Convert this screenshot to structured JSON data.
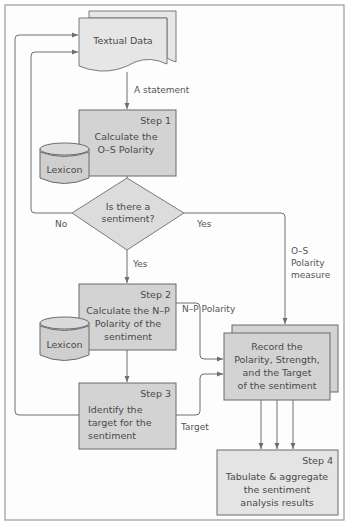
{
  "diagram": {
    "type": "flowchart",
    "nodes": {
      "textual_data": {
        "label": "Textual Data"
      },
      "step1": {
        "step": "Step 1",
        "lines": [
          "Calculate the",
          "O–S Polarity"
        ]
      },
      "lexicon1": {
        "label": "Lexicon"
      },
      "decision": {
        "lines": [
          "Is there a",
          "sentiment?"
        ]
      },
      "step2": {
        "step": "Step 2",
        "lines": [
          "Calculate the N–P",
          "Polarity of the",
          "sentiment"
        ]
      },
      "lexicon2": {
        "label": "Lexicon"
      },
      "step3": {
        "step": "Step 3",
        "lines": [
          "Identify the",
          "target for the",
          "sentiment"
        ]
      },
      "record": {
        "lines": [
          "Record the",
          "Polarity, Strength,",
          "and the Target",
          "of the sentiment"
        ]
      },
      "step4": {
        "step": "Step 4",
        "lines": [
          "Tabulate & aggregate",
          "the sentiment",
          "analysis results"
        ]
      }
    },
    "edge_labels": {
      "a_statement": "A statement",
      "no": "No",
      "yes_right": "Yes",
      "yes_down": "Yes",
      "os_measure": [
        "O–S",
        "Polarity",
        "measure"
      ],
      "np_polarity": "N–P Polarity",
      "target": "Target"
    }
  }
}
